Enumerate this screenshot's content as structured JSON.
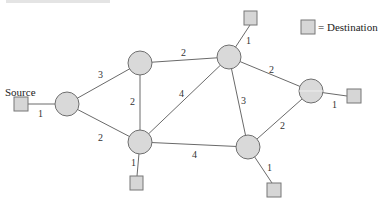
{
  "diagram": {
    "type": "weighted network graph",
    "cropped_caption": "",
    "legend": {
      "symbol": "square",
      "label": "= Destination"
    },
    "source": {
      "label": "Source",
      "x": 21,
      "y": 104,
      "edge_to": "A",
      "weight": "1"
    },
    "colors": {
      "node_fill": "#d9d9d9",
      "node_stroke": "#6f6f6f",
      "edge": "#6a6a6a",
      "text": "#222222"
    },
    "nodes": [
      {
        "id": "A",
        "x": 67,
        "y": 104
      },
      {
        "id": "B",
        "x": 140,
        "y": 63
      },
      {
        "id": "C",
        "x": 229,
        "y": 57
      },
      {
        "id": "D",
        "x": 311,
        "y": 91
      },
      {
        "id": "E",
        "x": 140,
        "y": 142
      },
      {
        "id": "F",
        "x": 248,
        "y": 147
      }
    ],
    "edges": [
      {
        "from": "A",
        "to": "B",
        "weight": "3"
      },
      {
        "from": "A",
        "to": "E",
        "weight": "2"
      },
      {
        "from": "B",
        "to": "C",
        "weight": "2"
      },
      {
        "from": "B",
        "to": "E",
        "weight": "2"
      },
      {
        "from": "E",
        "to": "C",
        "weight": "4"
      },
      {
        "from": "C",
        "to": "F",
        "weight": "3"
      },
      {
        "from": "C",
        "to": "D",
        "weight": "2"
      },
      {
        "from": "D",
        "to": "F",
        "weight": "2"
      },
      {
        "from": "E",
        "to": "F",
        "weight": "4"
      }
    ],
    "destinations": [
      {
        "attached_to": "C",
        "x": 251,
        "y": 18,
        "weight": "1"
      },
      {
        "attached_to": "D",
        "x": 354,
        "y": 96,
        "weight": "1"
      },
      {
        "attached_to": "E",
        "x": 136,
        "y": 183,
        "weight": "1"
      },
      {
        "attached_to": "F",
        "x": 274,
        "y": 190,
        "weight": "1"
      }
    ],
    "edge_labels": {
      "src_A": "1",
      "A_B": "3",
      "A_E": "2",
      "B_C": "2",
      "B_E": "2",
      "E_C": "4",
      "C_F": "3",
      "C_D": "2",
      "D_F": "2",
      "E_F": "4",
      "C_dest": "1",
      "D_dest": "1",
      "E_dest": "1",
      "F_dest": "1"
    }
  }
}
